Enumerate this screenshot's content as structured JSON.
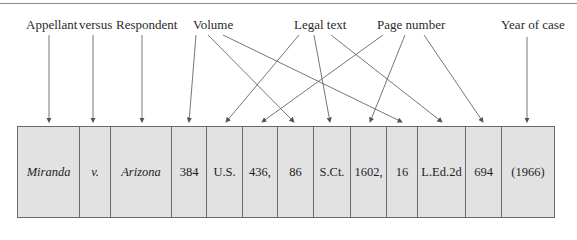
{
  "labels": {
    "appellant": "Appellant",
    "versus": "versus",
    "respondent": "Respondent",
    "volume": "Volume",
    "legal_text": "Legal text",
    "page_number": "Page number",
    "year_of_case": "Year of case"
  },
  "citation_cells": [
    {
      "text": "Miranda",
      "italic": true,
      "role": "Appellant"
    },
    {
      "text": "v.",
      "italic": true,
      "role": "versus"
    },
    {
      "text": "Arizona",
      "italic": true,
      "role": "Respondent"
    },
    {
      "text": "384",
      "italic": false,
      "role": "Volume"
    },
    {
      "text": "U.S.",
      "italic": false,
      "role": "Legal text"
    },
    {
      "text": "436,",
      "italic": false,
      "role": "Page number"
    },
    {
      "text": "86",
      "italic": false,
      "role": "Volume"
    },
    {
      "text": "S.Ct.",
      "italic": false,
      "role": "Legal text"
    },
    {
      "text": "1602,",
      "italic": false,
      "role": "Page number"
    },
    {
      "text": "16",
      "italic": false,
      "role": "Volume"
    },
    {
      "text": "L.Ed.2d",
      "italic": false,
      "role": "Legal text"
    },
    {
      "text": "694",
      "italic": false,
      "role": "Page number"
    },
    {
      "text": "(1966)",
      "italic": false,
      "role": "Year of case"
    }
  ],
  "colors": {
    "cell_fill": "#e2e2e2",
    "border": "#6a6a6a",
    "arrow": "#555555"
  }
}
